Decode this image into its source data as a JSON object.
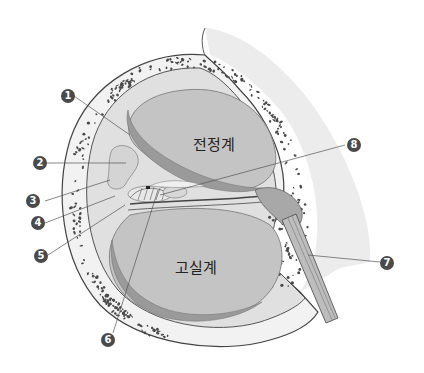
{
  "diagram": {
    "regions": [
      {
        "id": "scala-vestibuli",
        "label": "전정계"
      },
      {
        "id": "scala-tympani",
        "label": "고실계"
      }
    ],
    "callouts": [
      {
        "number": "1",
        "target": "reissner-membrane"
      },
      {
        "number": "2",
        "target": "spiral-limbus"
      },
      {
        "number": "3",
        "target": "inner-sulcus"
      },
      {
        "number": "4",
        "target": "spiral-ganglion-fibers"
      },
      {
        "number": "5",
        "target": "osseous-spiral-lamina"
      },
      {
        "number": "6",
        "target": "organ-of-corti"
      },
      {
        "number": "7",
        "target": "cochlear-nerve"
      },
      {
        "number": "8",
        "target": "tectorial-membrane"
      }
    ],
    "colors": {
      "bone_outer": "#f0f0f0",
      "bone_dots": "#4a4a4a",
      "duct_fill": "#c8c8c8",
      "duct_rim": "#9a9a9a",
      "callout": "#4a4a4a",
      "background": "#ffffff"
    }
  }
}
